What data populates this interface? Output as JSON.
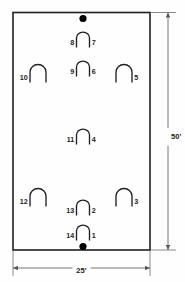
{
  "diagram": {
    "colors": {
      "stroke": "#231f20",
      "marker_fill": "#000000",
      "background": "#fefefe",
      "dimension_line": "#58595b"
    },
    "court": {
      "frame": {
        "x": 13,
        "y": 12.5,
        "width": 137,
        "height": 237.5,
        "stroke_width": 1.6
      },
      "shape": "rectangle"
    },
    "markers": [
      {
        "name": "top-center-dot",
        "cx": 83,
        "cy": 18.5,
        "r": 3.6
      },
      {
        "name": "bottom-center-dot",
        "cx": 83,
        "cy": 246.5,
        "r": 3.6
      }
    ],
    "arches": [
      {
        "id": "arch-8-7",
        "left_label": "8",
        "right_label": "7",
        "cx": 83,
        "cy": 41,
        "width": 13,
        "height": 13
      },
      {
        "id": "arch-9-6",
        "left_label": "9",
        "right_label": "6",
        "cx": 83,
        "cy": 70,
        "width": 13,
        "height": 13
      },
      {
        "id": "arch-10",
        "left_label": "10",
        "right_label": "",
        "cx": 38,
        "cy": 75,
        "width": 16,
        "height": 15
      },
      {
        "id": "arch-5",
        "left_label": "",
        "right_label": "5",
        "cx": 124,
        "cy": 75,
        "width": 16,
        "height": 15
      },
      {
        "id": "arch-11-4",
        "left_label": "11",
        "right_label": "4",
        "cx": 83,
        "cy": 138,
        "width": 13,
        "height": 13
      },
      {
        "id": "arch-12",
        "left_label": "12",
        "right_label": "",
        "cx": 38,
        "cy": 199,
        "width": 16,
        "height": 15
      },
      {
        "id": "arch-3",
        "left_label": "",
        "right_label": "3",
        "cx": 124,
        "cy": 199,
        "width": 16,
        "height": 15
      },
      {
        "id": "arch-13-2",
        "left_label": "13",
        "right_label": "2",
        "cx": 83,
        "cy": 209,
        "width": 13,
        "height": 13
      },
      {
        "id": "arch-14-1",
        "left_label": "14",
        "right_label": "1",
        "cx": 83,
        "cy": 234,
        "width": 13,
        "height": 13
      }
    ],
    "dimensions": {
      "height": {
        "name": "vertical-dimension",
        "label": "50'",
        "value": 50,
        "unit": "feet",
        "axis": "vertical",
        "line_x": 168,
        "y_start": 12.5,
        "y_end": 250,
        "label_x": 171,
        "label_y": 137
      },
      "width": {
        "name": "horizontal-dimension",
        "label": "25'",
        "value": 25,
        "unit": "feet",
        "axis": "horizontal",
        "line_y": 268,
        "x_start": 13,
        "x_end": 150,
        "label_x": 81.5,
        "label_y": 271
      }
    },
    "extension_lines": [
      {
        "name": "ext-top",
        "x1": 150,
        "y1": 12.5,
        "x2": 176,
        "y2": 12.5
      },
      {
        "name": "ext-bottom",
        "x1": 150,
        "y1": 250,
        "x2": 176,
        "y2": 250
      },
      {
        "name": "ext-left",
        "x1": 13,
        "y1": 250,
        "x2": 13,
        "y2": 276
      },
      {
        "name": "ext-right",
        "x1": 150,
        "y1": 250,
        "x2": 150,
        "y2": 276
      }
    ]
  }
}
